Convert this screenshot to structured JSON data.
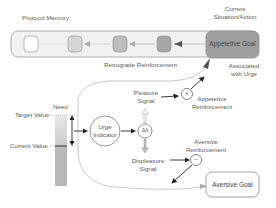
{
  "diagram": {
    "memory": {
      "title": "Protocol Memory",
      "current_label_line1": "Current",
      "current_label_line2": "Situation/Action",
      "goal": "Appetetive Goal",
      "retrograde": "Retrograde Reinforcement",
      "associated_line1": "Associated",
      "associated_line2": "with Urge",
      "slots": [
        {
          "fill": "#ffffff"
        },
        {
          "fill": "#d6d6d6"
        },
        {
          "fill": "#bcbcbc"
        },
        {
          "fill": "#a8a8a8"
        }
      ],
      "goal_fill": "#9e9e9e",
      "bar_fill": "#f0f0f0"
    },
    "need": {
      "title": "Need",
      "target": "Target Value",
      "current": "Current Value"
    },
    "urge": {
      "line1": "Urge",
      "line2": "Indicator"
    },
    "delta": {
      "symbol": "Δ/t"
    },
    "pleasure": {
      "line1": "Pleasure",
      "line2": "Signal"
    },
    "displeasure": {
      "line1": "Displeasure",
      "line2": "Signal"
    },
    "appetitive_reinf": {
      "line1": "Appetetive",
      "line2": "Reinforcement",
      "symbol": "+"
    },
    "aversive_reinf": {
      "line1": "Aversive",
      "line2": "Reinforcement",
      "symbol": "−"
    },
    "aversive_goal": "Aversive Goal"
  }
}
